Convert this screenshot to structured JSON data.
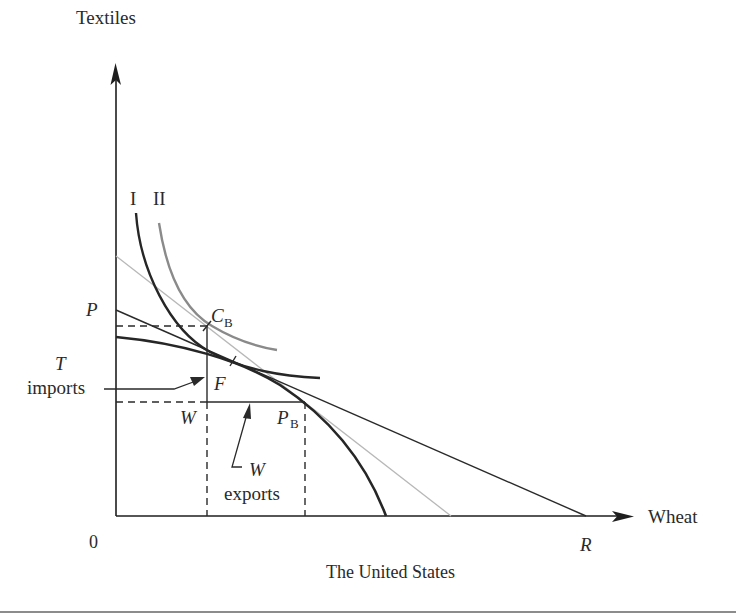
{
  "figure": {
    "title": "The United States",
    "axes": {
      "y_label": "Textiles",
      "x_label": "Wheat",
      "origin_label": "0"
    },
    "points": {
      "P": "P",
      "R": "R",
      "C": "C",
      "C_sub": "B",
      "PB": "P",
      "PB_sub": "B",
      "F": "F",
      "W": "W"
    },
    "curve_labels": {
      "curve_I": "I",
      "curve_II": "II"
    },
    "annotations": {
      "t_imports_letter": "T",
      "t_imports_word": "imports",
      "w_exports_letter": "W",
      "w_exports_word": "exports"
    },
    "colors": {
      "axis": "#1e1e1e",
      "ppf": "#262626",
      "indiff_I": "#262626",
      "indiff_II": "#8a8a8a",
      "world_price_line": "#2a2a2a",
      "autarky_price_line": "#b5b5b5",
      "dashed": "#2a2a2a",
      "rule": "#8c8c8c"
    }
  }
}
